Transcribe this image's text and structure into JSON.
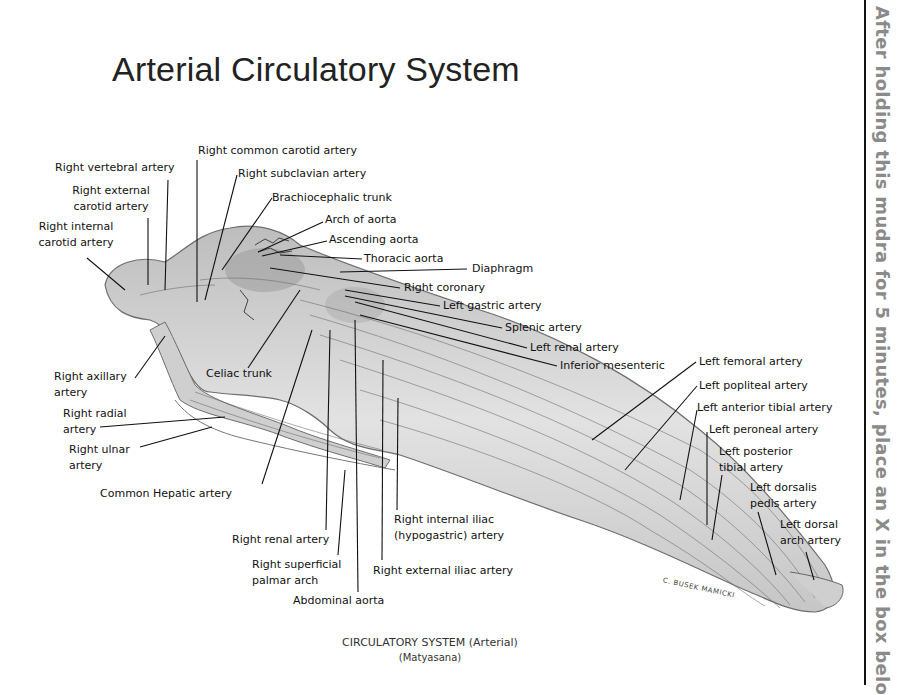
{
  "title": "Arterial Circulatory System",
  "caption": {
    "line1": "CIRCULATORY SYSTEM (Arterial)",
    "line2": "(Matyasana)"
  },
  "side_instruction": "After holding this mudra for 5 minutes, place an X in the box belo",
  "signature": "C. BUSEK MAMICKI",
  "labels": {
    "right_vertebral": "Right vertebral artery",
    "right_external_carotid_1": "Right external",
    "right_external_carotid_2": "carotid artery",
    "right_internal_carotid_1": "Right internal",
    "right_internal_carotid_2": "carotid artery",
    "right_common_carotid": "Right common carotid artery",
    "right_subclavian": "Right subclavian artery",
    "brachiocephalic": "Brachiocephalic trunk",
    "arch_aorta": "Arch of aorta",
    "ascending_aorta": "Ascending  aorta",
    "thoracic_aorta": "Thoracic aorta",
    "diaphragm": "Diaphragm",
    "right_coronary": "Right  coronary",
    "left_gastric": "Left gastric artery",
    "splenic": "Splenic artery",
    "left_renal": "Left renal artery",
    "inferior_mesenteric": "Inferior mesenteric",
    "right_axillary_1": "Right axillary",
    "right_axillary_2": "artery",
    "celiac_trunk": "Celiac trunk",
    "right_radial_1": "Right radial",
    "right_radial_2": "artery",
    "right_ulnar_1": "Right ulnar",
    "right_ulnar_2": "artery",
    "common_hepatic": "Common Hepatic  artery",
    "right_renal": "Right renal artery",
    "right_superficial_1": "Right superficial",
    "right_superficial_2": "palmar arch",
    "abdominal_aorta": "Abdominal aorta",
    "right_internal_iliac_1": "Right internal iliac",
    "right_internal_iliac_2": "(hypogastric) artery",
    "right_external_iliac": "Right external iliac artery",
    "left_femoral": "Left femoral artery",
    "left_popliteal": "Left popliteal artery",
    "left_anterior_tibial": "Left anterior tibial artery",
    "left_peroneal": "Left peroneal artery",
    "left_posterior_tibial_1": "Left posterior",
    "left_posterior_tibial_2": "tibial artery",
    "left_dorsalis_pedis_1": "Left dorsalis",
    "left_dorsalis_pedis_2": "pedis artery",
    "left_dorsal_arch_1": "Left dorsal",
    "left_dorsal_arch_2": "arch artery"
  },
  "colors": {
    "body_fill": "#d9d9d9",
    "body_shadow": "#9a9a9a",
    "vessel": "#555555",
    "leader": "#111111",
    "side_text": "#8a8a8a"
  }
}
